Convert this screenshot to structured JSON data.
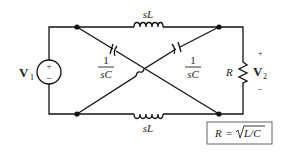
{
  "diagram": {
    "type": "circuit",
    "source": {
      "label": "V",
      "subscript": "1",
      "plus": "+",
      "minus": "−"
    },
    "inductor_top": {
      "label": "sL"
    },
    "inductor_bottom": {
      "label": "sL"
    },
    "capacitor_left": {
      "numerator": "1",
      "denominator": "sC"
    },
    "capacitor_right": {
      "numerator": "1",
      "denominator": "sC"
    },
    "resistor": {
      "label": "R"
    },
    "output": {
      "label": "V",
      "subscript": "2",
      "plus": "+",
      "minus": "−"
    },
    "formula": {
      "lhs": "R",
      "eq": "=",
      "rhs": "L/C"
    }
  }
}
